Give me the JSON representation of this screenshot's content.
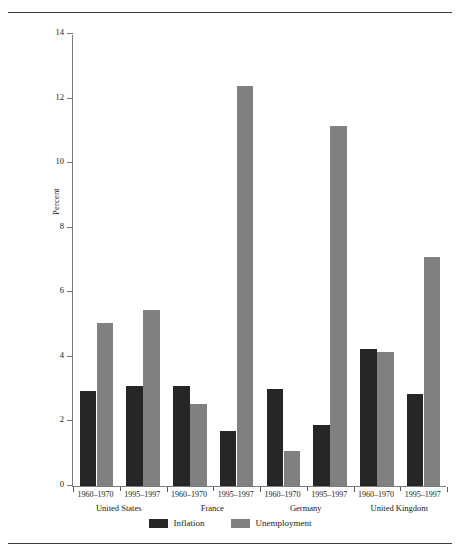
{
  "chart_data": {
    "type": "bar",
    "title": "",
    "subtitle": "",
    "xlabel": "",
    "ylabel": "Percent",
    "ylim": [
      0,
      14
    ],
    "yticks": [
      0,
      2,
      4,
      6,
      8,
      10,
      12,
      14
    ],
    "ytick_labels": [
      "0",
      "2",
      "4",
      "6",
      "8",
      "10",
      "12",
      "14"
    ],
    "grid": false,
    "legend_position": "bottom-center",
    "groups": [
      "United States",
      "France",
      "Germany",
      "United Kingdom"
    ],
    "periods": [
      "1960–1970",
      "1995–1997"
    ],
    "categories": [
      "United States 1960–1970",
      "United States 1995–1997",
      "France 1960–1970",
      "France 1995–1997",
      "Germany 1960–1970",
      "Germany 1995–1997",
      "United Kingdom 1960–1970",
      "United Kingdom 1995–1997"
    ],
    "series": [
      {
        "name": "Inflation",
        "color": "#262626",
        "values": [
          2.95,
          3.1,
          3.1,
          1.7,
          3.0,
          1.9,
          4.25,
          2.85
        ]
      },
      {
        "name": "Unemployment",
        "color": "#808080",
        "values": [
          5.05,
          5.45,
          2.55,
          12.4,
          1.1,
          11.15,
          4.15,
          7.1
        ]
      }
    ]
  },
  "axis": {
    "ylabel": "Percent",
    "ytick_labels": [
      "0",
      "2",
      "4",
      "6",
      "8",
      "10",
      "12",
      "14"
    ]
  },
  "xaxis": {
    "periods": [
      "1960–1970",
      "1995–1997",
      "1960–1970",
      "1995–1997",
      "1960–1970",
      "1995–1997",
      "1960–1970",
      "1995–1997"
    ],
    "countries": [
      "United States",
      "France",
      "Germany",
      "United Kingdom"
    ]
  },
  "legend": {
    "items": [
      {
        "label": "Inflation",
        "color": "#262626"
      },
      {
        "label": "Unemployment",
        "color": "#808080"
      }
    ]
  }
}
